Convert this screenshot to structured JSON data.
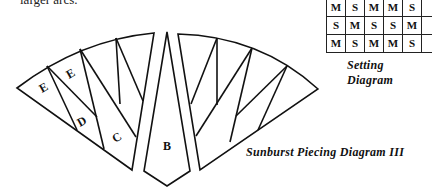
{
  "page": {
    "top_text": "larger arcs."
  },
  "setting_diagram": {
    "rows": [
      [
        "M",
        "S",
        "M",
        "M",
        "S",
        ""
      ],
      [
        "S",
        "M",
        "S",
        "S",
        "M",
        ""
      ],
      [
        "M",
        "S",
        "M",
        "M",
        "S",
        ""
      ]
    ],
    "caption": "Setting Diagram"
  },
  "piecing_diagram": {
    "caption": "Sunburst Piecing Diagram III",
    "labels": {
      "e1": "E",
      "e2": "E",
      "d": "D",
      "c": "C",
      "b": "B"
    }
  }
}
